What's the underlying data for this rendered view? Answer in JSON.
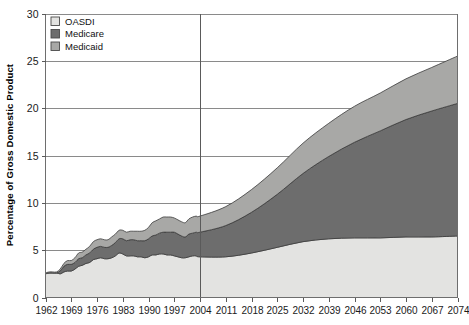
{
  "chart_data": {
    "type": "area",
    "title": "",
    "xlabel": "",
    "ylabel": "Percentage of Gross Domestic Product",
    "stacked": true,
    "grid": true,
    "legend_position": "top-left",
    "xlim": [
      1962,
      2074
    ],
    "ylim": [
      0,
      30
    ],
    "ytick_labels": [
      "0",
      "5",
      "10",
      "15",
      "20",
      "25",
      "30"
    ],
    "yticks": [
      0,
      5,
      10,
      15,
      20,
      25,
      30
    ],
    "xtick_labels": [
      "1962",
      "1969",
      "1976",
      "1983",
      "1990",
      "1997",
      "2004",
      "2011",
      "2018",
      "2025",
      "2032",
      "2039",
      "2046",
      "2053",
      "2060",
      "2067",
      "2074"
    ],
    "xticks": [
      1962,
      1969,
      1976,
      1983,
      1990,
      1997,
      2004,
      2011,
      2018,
      2025,
      2032,
      2039,
      2046,
      2053,
      2060,
      2067,
      2074
    ],
    "annotations": [
      {
        "type": "vertical-line",
        "x": 2004,
        "label": "actual / projected divider"
      }
    ],
    "colors": {
      "OASDI": "#e3e3e1",
      "Medicare": "#6d6d6d",
      "Medicaid": "#a8a8a6",
      "outline": "#3c3c3c",
      "gridline": "#8a8a8a",
      "axis": "#6e6e6e"
    },
    "x": [
      1962,
      1963,
      1964,
      1965,
      1966,
      1967,
      1968,
      1969,
      1970,
      1971,
      1972,
      1973,
      1974,
      1975,
      1976,
      1977,
      1978,
      1979,
      1980,
      1981,
      1982,
      1983,
      1984,
      1985,
      1986,
      1987,
      1988,
      1989,
      1990,
      1991,
      1992,
      1993,
      1994,
      1995,
      1996,
      1997,
      1998,
      1999,
      2000,
      2001,
      2002,
      2003,
      2004,
      2011,
      2018,
      2025,
      2032,
      2039,
      2046,
      2053,
      2060,
      2067,
      2074
    ],
    "series": [
      {
        "name": "OASDI",
        "values": [
          2.5,
          2.6,
          2.6,
          2.6,
          2.5,
          2.7,
          2.8,
          2.8,
          3.0,
          3.3,
          3.4,
          3.6,
          3.7,
          4.0,
          4.1,
          4.2,
          4.1,
          4.1,
          4.2,
          4.4,
          4.7,
          4.6,
          4.4,
          4.4,
          4.4,
          4.3,
          4.3,
          4.2,
          4.3,
          4.5,
          4.5,
          4.6,
          4.6,
          4.5,
          4.5,
          4.4,
          4.3,
          4.2,
          4.2,
          4.3,
          4.4,
          4.4,
          4.3,
          4.3,
          4.7,
          5.3,
          5.9,
          6.2,
          6.3,
          6.3,
          6.4,
          6.4,
          6.5
        ]
      },
      {
        "name": "Medicare",
        "values": [
          0.0,
          0.0,
          0.0,
          0.0,
          0.3,
          0.6,
          0.7,
          0.7,
          0.7,
          0.8,
          0.8,
          0.9,
          1.0,
          1.1,
          1.2,
          1.2,
          1.2,
          1.2,
          1.3,
          1.4,
          1.5,
          1.6,
          1.6,
          1.7,
          1.7,
          1.7,
          1.7,
          1.8,
          1.9,
          2.0,
          2.1,
          2.2,
          2.3,
          2.4,
          2.4,
          2.5,
          2.4,
          2.3,
          2.2,
          2.4,
          2.4,
          2.5,
          2.6,
          3.3,
          4.3,
          5.6,
          7.2,
          8.7,
          10.1,
          11.3,
          12.4,
          13.3,
          14.0
        ]
      },
      {
        "name": "Medicaid",
        "values": [
          0.1,
          0.1,
          0.1,
          0.1,
          0.2,
          0.3,
          0.4,
          0.4,
          0.5,
          0.6,
          0.6,
          0.6,
          0.7,
          0.8,
          0.8,
          0.8,
          0.8,
          0.8,
          0.9,
          0.9,
          0.9,
          0.9,
          0.9,
          0.9,
          0.9,
          1.0,
          1.0,
          1.1,
          1.2,
          1.4,
          1.5,
          1.5,
          1.6,
          1.6,
          1.6,
          1.5,
          1.5,
          1.5,
          1.5,
          1.6,
          1.7,
          1.7,
          1.7,
          2.0,
          2.4,
          2.8,
          3.2,
          3.5,
          3.8,
          4.0,
          4.3,
          4.6,
          5.0
        ]
      }
    ],
    "totals_note": {
      "1962": 2.6,
      "2004": 8.6,
      "2074": 25.5
    }
  },
  "legend": {
    "items": [
      {
        "label": "OASDI",
        "color": "#e3e3e1"
      },
      {
        "label": "Medicare",
        "color": "#6d6d6d"
      },
      {
        "label": "Medicaid",
        "color": "#a8a8a6"
      }
    ]
  }
}
